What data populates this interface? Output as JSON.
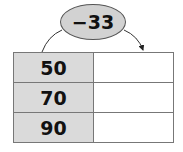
{
  "operation": {
    "label": "−33",
    "operator": "minus",
    "operand": 33
  },
  "table": {
    "rows": [
      {
        "input": "50",
        "output": ""
      },
      {
        "input": "70",
        "output": ""
      },
      {
        "input": "90",
        "output": ""
      }
    ]
  },
  "colors": {
    "input_fill": "#dadada",
    "oval_fill": "#d2d2d2",
    "border": "#777777"
  }
}
